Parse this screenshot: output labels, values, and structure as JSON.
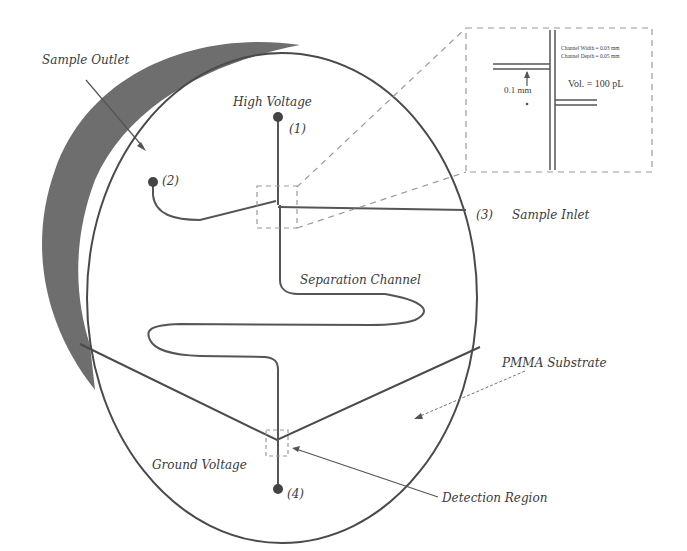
{
  "diagram": {
    "type": "microfluidic electrophoresis chip schematic",
    "labels": {
      "sample_outlet": "Sample Outlet",
      "high_voltage": "High Voltage",
      "port1": "(1)",
      "port2": "(2)",
      "port3": "(3)",
      "sample_inlet": "Sample Inlet",
      "separation_channel": "Separation Channel",
      "pmma_substrate": "PMMA Substrate",
      "ground_voltage": "Ground Voltage",
      "port4": "(4)",
      "detection_region": "Detection Region"
    },
    "inset": {
      "channel_width": "Channel Width = 0.03 mm",
      "channel_depth": "Channel Depth = 0.05 mm",
      "volume": "Vol. = 100 pL",
      "offset": "0.1 mm"
    },
    "colors": {
      "line": "#4a4a4a",
      "shadow": "#6e6e6e",
      "dashed": "#9a9a9a",
      "background": "#ffffff"
    }
  }
}
